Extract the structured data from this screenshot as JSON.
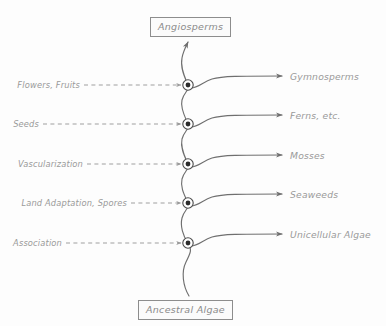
{
  "diagram": {
    "type": "evolutionary-tree",
    "root_label": "Ancestral Algae",
    "apex_label": "Angiosperms",
    "trunk_color": "#6f6f6f",
    "label_color": "#9a9a9a",
    "box_border_color": "#8d8d8d",
    "dashed_arrow_color": "#9a9a9a",
    "background_color": "#fdfdfd",
    "nodes": [
      {
        "id": "node-1",
        "trait": "Flowers, Fruits",
        "lineage": "Gymnosperms",
        "x": 188,
        "y": 85
      },
      {
        "id": "node-2",
        "trait": "Seeds",
        "lineage": "Ferns, etc.",
        "x": 188,
        "y": 124
      },
      {
        "id": "node-3",
        "trait": "Vascularization",
        "lineage": "Mosses",
        "x": 188,
        "y": 164
      },
      {
        "id": "node-4",
        "trait": "Land Adaptation, Spores",
        "lineage": "Seaweeds",
        "x": 188,
        "y": 203
      },
      {
        "id": "node-5",
        "trait": "Association",
        "lineage": "Unicellular Algae",
        "x": 188,
        "y": 243
      }
    ]
  }
}
